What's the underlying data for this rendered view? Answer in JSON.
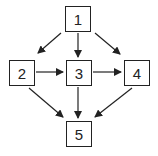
{
  "diagram": {
    "type": "directed-graph",
    "nodes": [
      {
        "id": "1",
        "label": "1",
        "x": 65,
        "y": 6,
        "w": 26,
        "h": 26
      },
      {
        "id": "2",
        "label": "2",
        "x": 9,
        "y": 60,
        "w": 26,
        "h": 26
      },
      {
        "id": "3",
        "label": "3",
        "x": 66,
        "y": 60,
        "w": 26,
        "h": 26
      },
      {
        "id": "4",
        "label": "4",
        "x": 124,
        "y": 60,
        "w": 26,
        "h": 26
      },
      {
        "id": "5",
        "label": "5",
        "x": 66,
        "y": 121,
        "w": 26,
        "h": 26
      }
    ],
    "edges": [
      {
        "from": "1",
        "to": "2"
      },
      {
        "from": "1",
        "to": "3"
      },
      {
        "from": "1",
        "to": "4"
      },
      {
        "from": "2",
        "to": "3"
      },
      {
        "from": "3",
        "to": "4"
      },
      {
        "from": "2",
        "to": "5"
      },
      {
        "from": "3",
        "to": "5"
      },
      {
        "from": "4",
        "to": "5"
      }
    ],
    "colors": {
      "stroke": "#222222",
      "background": "#ffffff"
    }
  }
}
